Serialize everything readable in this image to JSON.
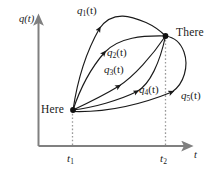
{
  "figure": {
    "type": "diagram",
    "background_color": "#ffffff",
    "axis_color": "#808080",
    "curve_color": "#1a1a1a",
    "guide_color": "#9a9a9a",
    "axes": {
      "y_label": "q(t)",
      "x_label": "t",
      "x_ticks": [
        {
          "id": "t1",
          "base": "t",
          "sub": "1"
        },
        {
          "id": "t2",
          "base": "t",
          "sub": "2"
        }
      ]
    },
    "endpoints": [
      {
        "id": "here",
        "label": "Here",
        "time_tick": "t1"
      },
      {
        "id": "there",
        "label": "There",
        "time_tick": "t2"
      }
    ],
    "paths": [
      {
        "id": "q1",
        "base": "q",
        "sub": "1",
        "arg": "(t)",
        "label": "q1(t)",
        "shape": "high arcing path bowing far above the straight line"
      },
      {
        "id": "q2",
        "base": "q",
        "sub": "2",
        "arg": "(t)",
        "label": "q2(t)",
        "shape": "moderate arc bowing above the straight line"
      },
      {
        "id": "q3",
        "base": "q",
        "sub": "3",
        "arg": "(t)",
        "label": "q3(t)",
        "shape": "near-straight path from Here to There"
      },
      {
        "id": "q4",
        "base": "q",
        "sub": "4",
        "arg": "(t)",
        "label": "q4(t)",
        "shape": "path bowing below the straight line"
      },
      {
        "id": "q5",
        "base": "q",
        "sub": "5",
        "arg": "(t)",
        "label": "q5(t)",
        "shape": "lowest path looping out past t2 and back to There"
      }
    ]
  }
}
